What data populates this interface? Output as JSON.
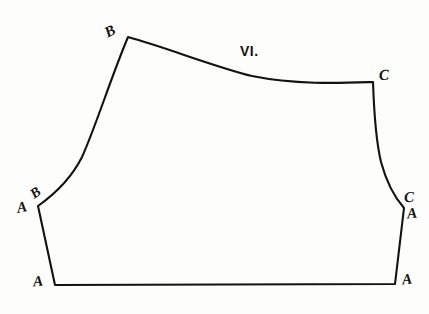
{
  "figure": {
    "plate_title": "VI.",
    "background_color": "#fdfdfc",
    "ink_color": "#141210",
    "stroke_width": 2.1,
    "width": 429,
    "height": 314
  },
  "labels": [
    {
      "id": "b-top",
      "text": "B",
      "x": 112,
      "y": 31,
      "rotation": -28
    },
    {
      "id": "c-top",
      "text": "C",
      "x": 386,
      "y": 75,
      "rotation": -4
    },
    {
      "id": "a-left-mid",
      "text": "A",
      "x": 24,
      "y": 207,
      "rotation": -10
    },
    {
      "id": "b-left-mid",
      "text": "B",
      "x": 38,
      "y": 193,
      "rotation": -36
    },
    {
      "id": "c-right-mid",
      "text": "C",
      "x": 411,
      "y": 197,
      "rotation": -3
    },
    {
      "id": "a-right-mid",
      "text": "A",
      "x": 414,
      "y": 213,
      "rotation": -6
    },
    {
      "id": "a-bottom-left",
      "text": "A",
      "x": 40,
      "y": 281,
      "rotation": -6
    },
    {
      "id": "a-bottom-right",
      "text": "A",
      "x": 409,
      "y": 279,
      "rotation": -6
    }
  ],
  "outline": {
    "description": "Closed pattern outline: apex B at top-left, concave top edge sweeping right to corner C, right side curving down and flaring out to right waist point, straight hem across the bottom, left side rising to left waist point, then long S-curve back up to apex B.",
    "vertices": {
      "b_apex": {
        "x": 128,
        "y": 37
      },
      "c_corner": {
        "x": 373,
        "y": 82
      },
      "right_waist": {
        "x": 404,
        "y": 208
      },
      "bottom_right": {
        "x": 395,
        "y": 284
      },
      "bottom_left": {
        "x": 55,
        "y": 285
      },
      "left_waist": {
        "x": 38,
        "y": 206
      }
    },
    "path": "M 128 37 C 168 48, 212 66, 252 76 C 296 85, 342 83, 373 82 L 373 82 C 374 112, 376 141, 381 162 C 387 184, 396 199, 404 208 L 395 284 L 55 285 L 38 206 C 52 196, 70 181, 82 157 C 96 126, 110 80, 128 37 Z"
  },
  "chart_data": {
    "type": "line",
    "title": "VI.",
    "xlabel": "",
    "ylabel": "",
    "series": [
      {
        "name": "pattern-outline",
        "points": [
          [
            128,
            37
          ],
          [
            168,
            48
          ],
          [
            212,
            66
          ],
          [
            252,
            76
          ],
          [
            296,
            85
          ],
          [
            373,
            82
          ],
          [
            376,
            141
          ],
          [
            381,
            162
          ],
          [
            396,
            199
          ],
          [
            404,
            208
          ],
          [
            395,
            284
          ],
          [
            55,
            285
          ],
          [
            38,
            206
          ],
          [
            52,
            196
          ],
          [
            82,
            157
          ],
          [
            110,
            80
          ],
          [
            128,
            37
          ]
        ]
      }
    ],
    "annotations": [
      {
        "text": "B",
        "x": 112,
        "y": 31
      },
      {
        "text": "VI.",
        "x": 240,
        "y": 44
      },
      {
        "text": "C",
        "x": 386,
        "y": 75
      },
      {
        "text": "B",
        "x": 38,
        "y": 193
      },
      {
        "text": "A",
        "x": 24,
        "y": 207
      },
      {
        "text": "C",
        "x": 411,
        "y": 197
      },
      {
        "text": "A",
        "x": 414,
        "y": 213
      },
      {
        "text": "A",
        "x": 40,
        "y": 281
      },
      {
        "text": "A",
        "x": 409,
        "y": 279
      }
    ],
    "xlim": [
      0,
      429
    ],
    "ylim": [
      314,
      0
    ],
    "grid": false,
    "legend": null
  }
}
